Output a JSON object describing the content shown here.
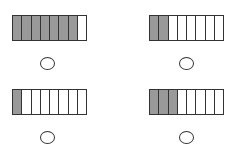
{
  "figures": [
    {
      "id": "top-left",
      "segments": 8,
      "shaded": 7,
      "answer_circle": ""
    },
    {
      "id": "top-right",
      "segments": 8,
      "shaded": 2,
      "answer_circle": ""
    },
    {
      "id": "bottom-left",
      "segments": 8,
      "shaded": 1,
      "answer_circle": ""
    },
    {
      "id": "bottom-right",
      "segments": 8,
      "shaded": 3,
      "answer_circle": ""
    }
  ],
  "colors": {
    "shaded": "#999999",
    "unshaded": "#ffffff",
    "outline": "#333333"
  }
}
